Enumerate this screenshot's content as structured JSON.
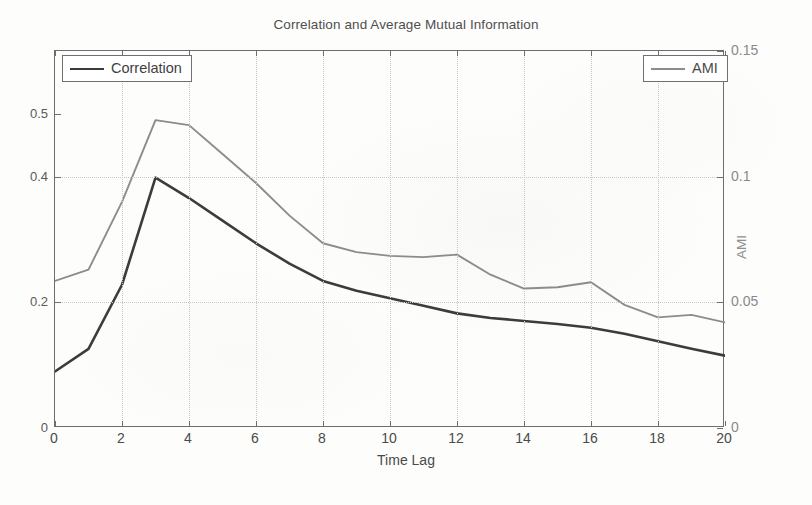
{
  "chart_data": {
    "type": "line",
    "title": "Correlation and Average Mutual Information",
    "xlabel": "Time Lag",
    "ylabel": "",
    "ylabel_right": "AMI",
    "grid": true,
    "legend_position": "top-left and top-right (inside axes)",
    "x": [
      0,
      1,
      2,
      3,
      4,
      5,
      6,
      7,
      8,
      9,
      10,
      11,
      12,
      13,
      14,
      15,
      16,
      17,
      18,
      19,
      20
    ],
    "xlim": [
      0,
      20
    ],
    "xticks": [
      "0",
      "2",
      "4",
      "6",
      "8",
      "10",
      "12",
      "14",
      "16",
      "18",
      "20"
    ],
    "xtick_values": [
      0,
      2,
      4,
      6,
      8,
      10,
      12,
      14,
      16,
      18,
      20
    ],
    "ylim_left": [
      0.1,
      0.6
    ],
    "yticks_left": [
      "0.2",
      "0.4",
      "0.5"
    ],
    "yticks_left_note": "left tick labels are clipped by the page edge in the scan",
    "ylim_right": [
      0,
      0.15
    ],
    "yticks_right": [
      "0",
      "0.05",
      "0.1",
      "0.15"
    ],
    "ytick_values_right": [
      0,
      0.05,
      0.1,
      0.15
    ],
    "series": [
      {
        "name": "Correlation",
        "axis": "left",
        "color": "#3c3c3c",
        "values": [
          0.175,
          0.205,
          0.29,
          0.432,
          0.405,
          0.375,
          0.345,
          0.318,
          0.295,
          0.282,
          0.272,
          0.262,
          0.252,
          0.246,
          0.242,
          0.238,
          0.233,
          0.225,
          0.215,
          0.205,
          0.196
        ]
      },
      {
        "name": "AMI",
        "axis": "right",
        "color": "#8c8c8c",
        "values": [
          0.0585,
          0.063,
          0.09,
          0.1225,
          0.1205,
          0.109,
          0.0975,
          0.0845,
          0.0735,
          0.07,
          0.0685,
          0.068,
          0.069,
          0.061,
          0.0555,
          0.056,
          0.058,
          0.049,
          0.044,
          0.045,
          0.042
        ]
      }
    ]
  },
  "title": {
    "text": "Correlation and Average Mutual Information"
  },
  "axes": {
    "x_title": "Time Lag",
    "y_right_title": "AMI",
    "x_ticks": [
      "0",
      "2",
      "4",
      "6",
      "8",
      "10",
      "12",
      "14",
      "16",
      "18",
      "20"
    ],
    "y_left_ticks": [
      "0.2",
      "0.4",
      "0.5"
    ],
    "y_right_ticks": [
      "0",
      "0.05",
      "0.1",
      "0.15"
    ]
  },
  "legend": {
    "correlation_label": "Correlation",
    "ami_label": "AMI"
  },
  "colors": {
    "correlation": "#3c3c3c",
    "ami": "#8c8c8c",
    "axis": "#6e6e6e",
    "grid": "#c9c6c2",
    "background": "#fdfdfc"
  }
}
